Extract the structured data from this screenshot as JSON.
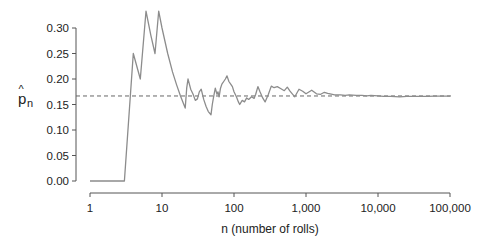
{
  "chart_data": {
    "type": "line",
    "title": "",
    "xlabel": "n (number of rolls)",
    "ylabel": "p̂n",
    "ylabel_parts": {
      "main": "p",
      "hat": "^",
      "sub": "n"
    },
    "x_scale": "log10",
    "xlim": [
      1,
      100000
    ],
    "ylim": [
      0.0,
      0.3333
    ],
    "x_ticks": [
      1,
      10,
      100,
      1000,
      10000,
      100000
    ],
    "x_tick_labels": [
      "1",
      "10",
      "100",
      "1,000",
      "10,000",
      "100,000"
    ],
    "y_ticks": [
      0.0,
      0.05,
      0.1,
      0.15,
      0.2,
      0.25,
      0.3
    ],
    "y_tick_labels": [
      "0.00",
      "0.05",
      "0.10",
      "0.15",
      "0.20",
      "0.25",
      "0.30"
    ],
    "grid": false,
    "legend": null,
    "reference_line": {
      "y": 0.1667,
      "style": "dashed",
      "color": "#666666",
      "label": "1/6"
    },
    "series": [
      {
        "name": "running proportion of sixes",
        "color": "#8c8c8c",
        "x": [
          1,
          2,
          3,
          4,
          5,
          6,
          7,
          8,
          9,
          10,
          12,
          14,
          16,
          18,
          21,
          22,
          23,
          25,
          27,
          29,
          31,
          33,
          35,
          38,
          41,
          44,
          48,
          50,
          52,
          55,
          58,
          60,
          62,
          65,
          68,
          72,
          76,
          80,
          85,
          90,
          95,
          100,
          108,
          115,
          120,
          130,
          140,
          150,
          160,
          175,
          190,
          200,
          215,
          230,
          250,
          270,
          300,
          330,
          360,
          400,
          450,
          500,
          550,
          600,
          700,
          800,
          900,
          1000,
          1200,
          1400,
          1600,
          1800,
          2000,
          2500,
          3000,
          3500,
          4000,
          5000,
          6000,
          7000,
          8000,
          10000,
          12000,
          15000,
          20000,
          25000,
          30000,
          40000,
          50000,
          60000,
          70000,
          80000,
          90000,
          100000
        ],
        "values": [
          0.0,
          0.0,
          0.0,
          0.25,
          0.2,
          0.333,
          0.286,
          0.25,
          0.333,
          0.3,
          0.25,
          0.214,
          0.188,
          0.167,
          0.143,
          0.182,
          0.2,
          0.18,
          0.17,
          0.158,
          0.161,
          0.175,
          0.18,
          0.16,
          0.146,
          0.136,
          0.13,
          0.15,
          0.165,
          0.182,
          0.17,
          0.175,
          0.165,
          0.182,
          0.19,
          0.195,
          0.2,
          0.206,
          0.195,
          0.19,
          0.185,
          0.175,
          0.165,
          0.155,
          0.15,
          0.158,
          0.155,
          0.163,
          0.16,
          0.165,
          0.162,
          0.17,
          0.185,
          0.175,
          0.163,
          0.155,
          0.17,
          0.186,
          0.183,
          0.185,
          0.181,
          0.177,
          0.184,
          0.176,
          0.165,
          0.18,
          0.176,
          0.171,
          0.178,
          0.171,
          0.17,
          0.174,
          0.172,
          0.169,
          0.169,
          0.168,
          0.169,
          0.168,
          0.168,
          0.167,
          0.168,
          0.167,
          0.166,
          0.166,
          0.165,
          0.166,
          0.166,
          0.166,
          0.166,
          0.1665,
          0.1665,
          0.1665,
          0.1665,
          0.1665
        ]
      }
    ]
  }
}
